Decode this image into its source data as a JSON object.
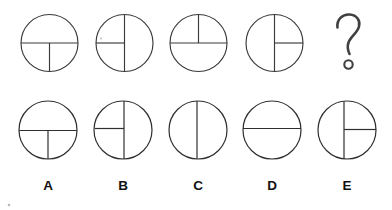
{
  "puzzle": {
    "type": "visual-analogy-sequence",
    "title": "Circle with diameter and radius sequence puzzle",
    "geometry": {
      "top_row": {
        "center_y": 43,
        "radius": 28.5,
        "centers_x": [
          49.5,
          124.5,
          198.5,
          274.5
        ]
      },
      "bottom_row": {
        "center_y": 130,
        "radius": 29,
        "centers_x": [
          48,
          123,
          198,
          272,
          347
        ]
      },
      "label_y": 190
    },
    "colors": {
      "background": "#ffffff",
      "figure_stroke": "#3a3a3a",
      "option_stroke": "#2f2f2f",
      "label_text": "#121212",
      "question_mark": "#404040"
    }
  },
  "sequence": {
    "name": "top-row-sequence",
    "figures": [
      {
        "id": "figure-1",
        "position": 1,
        "diameter": "horizontal",
        "radius": "down",
        "description": "Circle with full horizontal diameter and a vertical radius from center to bottom"
      },
      {
        "id": "figure-2",
        "position": 2,
        "diameter": "vertical",
        "radius": "left",
        "description": "Circle with full vertical diameter and a horizontal radius from center to left"
      },
      {
        "id": "figure-3",
        "position": 3,
        "diameter": "horizontal",
        "radius": "up",
        "description": "Circle with full horizontal diameter and a vertical radius from center to top"
      },
      {
        "id": "figure-4",
        "position": 4,
        "diameter": "vertical",
        "radius": "right",
        "description": "Circle with full vertical diameter and a horizontal radius from center to right"
      }
    ],
    "missing": {
      "id": "figure-5-unknown",
      "position": 5,
      "symbol": "?",
      "icon_name": "question-mark-icon",
      "description": "Unknown figure to be determined"
    }
  },
  "options": {
    "name": "answer-options",
    "items": [
      {
        "label": "A",
        "diameter": "horizontal",
        "radius": "down",
        "description": "Circle with full horizontal diameter and a vertical radius from center to bottom"
      },
      {
        "label": "B",
        "diameter": "vertical",
        "radius": "left",
        "description": "Circle with full vertical diameter and a horizontal radius from center to left"
      },
      {
        "label": "C",
        "diameter": "vertical",
        "radius": "none",
        "description": "Circle with only a full vertical diameter"
      },
      {
        "label": "D",
        "diameter": "horizontal",
        "radius": "none",
        "description": "Circle with only a full horizontal diameter"
      },
      {
        "label": "E",
        "diameter": "vertical",
        "radius": "right",
        "description": "Circle with full vertical diameter and a horizontal radius from center to right"
      }
    ]
  }
}
